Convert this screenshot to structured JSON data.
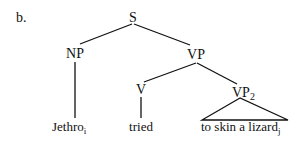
{
  "example_label": "b.",
  "tree": {
    "root": {
      "label": "S"
    },
    "np": {
      "label": "NP",
      "leaf": {
        "text": "Jethro",
        "subscript": "i"
      }
    },
    "vp": {
      "label": "VP"
    },
    "v": {
      "label": "V",
      "leaf": {
        "text": "tried"
      }
    },
    "vp2": {
      "label": "VP",
      "label_subscript": "2",
      "leaf": {
        "text": "to skin a lizard",
        "subscript": "j"
      }
    }
  },
  "colors": {
    "ink": "#111111",
    "background": "#ffffff"
  }
}
